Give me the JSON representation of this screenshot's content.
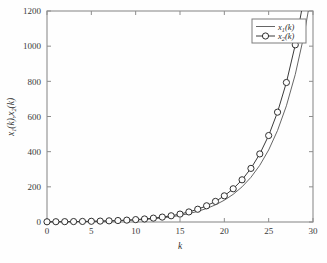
{
  "chart_data": {
    "type": "line",
    "title": "",
    "xlabel": "k",
    "ylabel": "x₁(k),x₂(k)",
    "ylabel_parts": {
      "base1": "x",
      "sub1": "1",
      "mid": "(k),",
      "base2": "x",
      "sub2": "2",
      "end": "(k)"
    },
    "xlim": [
      0,
      30
    ],
    "ylim": [
      0,
      1200
    ],
    "xticks": [
      0,
      5,
      10,
      15,
      20,
      25,
      30
    ],
    "yticks": [
      0,
      200,
      400,
      600,
      800,
      1000,
      1200
    ],
    "xtick_labels": [
      "0",
      "5",
      "10",
      "15",
      "20",
      "25",
      "30"
    ],
    "ytick_labels": [
      "0",
      "200",
      "400",
      "600",
      "800",
      "1000",
      "1200"
    ],
    "grid": false,
    "legend_position": "upper right",
    "x": [
      0,
      1,
      2,
      3,
      4,
      5,
      6,
      7,
      8,
      9,
      10,
      11,
      12,
      13,
      14,
      15,
      16,
      17,
      18,
      19,
      20,
      21,
      22,
      23,
      24,
      25,
      26,
      27,
      28,
      29,
      30
    ],
    "series": [
      {
        "name": "x₁(k)",
        "label_parts": {
          "base": "x",
          "sub": "1",
          "tail": "(k)"
        },
        "marker": "none",
        "color": "#555555",
        "values": [
          1.0,
          1.3,
          1.6,
          2.1,
          2.6,
          3.4,
          4.3,
          5.5,
          7.0,
          8.9,
          11.3,
          14.4,
          18.3,
          23.2,
          29.5,
          37.5,
          47.6,
          60.5,
          76.8,
          97.6,
          124.0,
          157.4,
          200.0,
          254.0,
          322.6,
          409.7,
          520.3,
          660.8,
          839.2,
          1065.8,
          1353.6
        ]
      },
      {
        "name": "x₂(k)",
        "label_parts": {
          "base": "x",
          "sub": "2",
          "tail": "(k)"
        },
        "marker": "circle",
        "color": "#3b3b3b",
        "values": [
          1.2,
          1.6,
          2.0,
          2.5,
          3.2,
          4.1,
          5.2,
          6.6,
          8.4,
          10.7,
          13.6,
          17.3,
          22.0,
          27.9,
          35.4,
          45.0,
          57.2,
          72.6,
          92.2,
          117.1,
          148.8,
          189.0,
          240.0,
          304.9,
          387.2,
          491.8,
          624.6,
          793.3,
          1007.6,
          1279.7,
          1625.0
        ]
      }
    ],
    "last_visible_points": {
      "x1_at_k30_approx": 910,
      "x2_at_k30_approx": 1042
    }
  },
  "legend": {
    "entries": [
      {
        "label": "x₁(k)",
        "style": "line"
      },
      {
        "label": "x₂(k)",
        "style": "line-circle"
      }
    ]
  },
  "axes": {
    "x_title": "k",
    "y_title": "x₁(k),x₂(k)"
  }
}
